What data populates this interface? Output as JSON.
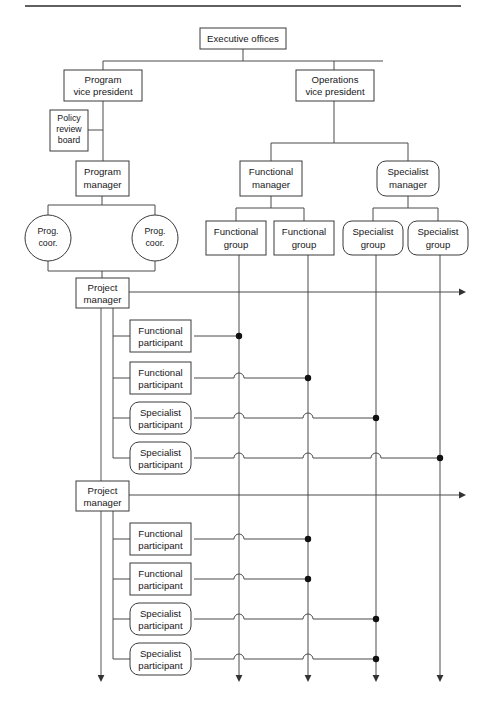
{
  "page": {
    "background_color": "#ffffff",
    "line_color": "#4a4a4a",
    "text_color": "#17171a",
    "top_rule": {
      "x1": 25,
      "y1": 6,
      "x2": 461,
      "y2": 6
    }
  },
  "nodes": {
    "executive_offices": {
      "label": "Executive offices",
      "shape": "rect",
      "x": 200,
      "y": 28,
      "w": 86,
      "h": 21
    },
    "program_vp": {
      "label_line1": "Program",
      "label_line2": "vice president",
      "shape": "rect",
      "x": 64,
      "y": 70,
      "w": 78,
      "h": 31
    },
    "operations_vp": {
      "label_line1": "Operations",
      "label_line2": "vice president",
      "shape": "rect",
      "x": 296,
      "y": 70,
      "w": 78,
      "h": 31
    },
    "policy_review_board": {
      "label_line1": "Policy",
      "label_line2": "review",
      "label_line3": "board",
      "shape": "rect",
      "x": 50,
      "y": 110,
      "w": 38,
      "h": 41
    },
    "program_manager": {
      "label_line1": "Program",
      "label_line2": "manager",
      "shape": "rect",
      "x": 76,
      "y": 161,
      "w": 53,
      "h": 35
    },
    "functional_manager": {
      "label_line1": "Functional",
      "label_line2": "manager",
      "shape": "rect",
      "x": 240,
      "y": 161,
      "w": 62,
      "h": 35
    },
    "specialist_manager": {
      "label_line1": "Specialist",
      "label_line2": "manager",
      "shape": "rounded",
      "x": 377,
      "y": 161,
      "w": 62,
      "h": 35
    },
    "prog_coor_left": {
      "label_line1": "Prog.",
      "label_line2": "coor.",
      "shape": "ellipse",
      "cx": 48,
      "cy": 238,
      "rx": 23,
      "ry": 23
    },
    "prog_coor_right": {
      "label_line1": "Prog.",
      "label_line2": "coor.",
      "shape": "ellipse",
      "cx": 155,
      "cy": 238,
      "rx": 23,
      "ry": 23
    },
    "functional_group_1": {
      "label_line1": "Functional",
      "label_line2": "group",
      "shape": "rect",
      "x": 206,
      "y": 221,
      "w": 60,
      "h": 34
    },
    "functional_group_2": {
      "label_line1": "Functional",
      "label_line2": "group",
      "shape": "rect",
      "x": 274,
      "y": 221,
      "w": 60,
      "h": 34
    },
    "specialist_group_1": {
      "label_line1": "Specialist",
      "label_line2": "group",
      "shape": "rounded",
      "x": 343,
      "y": 221,
      "w": 60,
      "h": 34
    },
    "specialist_group_2": {
      "label_line1": "Specialist",
      "label_line2": "group",
      "shape": "rounded",
      "x": 408,
      "y": 221,
      "w": 60,
      "h": 34
    },
    "project_manager_1": {
      "label_line1": "Project",
      "label_line2": "manager",
      "shape": "rect",
      "x": 76,
      "y": 278,
      "w": 53,
      "h": 30
    },
    "project_manager_2": {
      "label_line1": "Project",
      "label_line2": "manager",
      "shape": "rect",
      "x": 76,
      "y": 481,
      "w": 53,
      "h": 30
    }
  },
  "participant_label_functional_1": "Functional",
  "participant_label_functional_2": "participant",
  "participant_label_specialist_1": "Specialist",
  "participant_label_specialist_2": "participant",
  "columns": {
    "labels": [
      "Functional group",
      "Functional group",
      "Specialist group",
      "Specialist group"
    ],
    "x_positions": [
      239,
      308,
      376,
      440
    ],
    "top_y": 255,
    "bottom_y": 678
  },
  "blocks": [
    {
      "project_manager": "Project manager",
      "box_x": 130,
      "box_w": 61,
      "bus_x": 113,
      "arrow_y": 292,
      "arrow_end_x": 466,
      "participants": [
        {
          "type": "functional",
          "line1": "Functional",
          "line2": "participant",
          "y": 320,
          "h": 32,
          "shape": "rect",
          "terminates_at_column": 0,
          "hops_over": []
        },
        {
          "type": "functional",
          "line1": "Functional",
          "line2": "participant",
          "y": 362,
          "h": 32,
          "shape": "rect",
          "terminates_at_column": 1,
          "hops_over": [
            0
          ]
        },
        {
          "type": "specialist",
          "line1": "Specialist",
          "line2": "participant",
          "y": 402,
          "h": 32,
          "shape": "rounded",
          "terminates_at_column": 2,
          "hops_over": [
            0,
            1
          ]
        },
        {
          "type": "specialist",
          "line1": "Specialist",
          "line2": "participant",
          "y": 442,
          "h": 32,
          "shape": "rounded",
          "terminates_at_column": 3,
          "hops_over": [
            0,
            1,
            2
          ]
        }
      ]
    },
    {
      "project_manager": "Project manager",
      "box_x": 130,
      "box_w": 61,
      "bus_x": 113,
      "arrow_y": 495,
      "arrow_end_x": 466,
      "participants": [
        {
          "type": "functional",
          "line1": "Functional",
          "line2": "participant",
          "y": 523,
          "h": 32,
          "shape": "rect",
          "terminates_at_column": 1,
          "hops_over": [
            0
          ]
        },
        {
          "type": "functional",
          "line1": "Functional",
          "line2": "participant",
          "y": 563,
          "h": 32,
          "shape": "rect",
          "terminates_at_column": 1,
          "hops_over": [
            0
          ]
        },
        {
          "type": "specialist",
          "line1": "Specialist",
          "line2": "participant",
          "y": 603,
          "h": 32,
          "shape": "rounded",
          "terminates_at_column": 2,
          "hops_over": [
            0,
            1
          ]
        },
        {
          "type": "specialist",
          "line1": "Specialist",
          "line2": "participant",
          "y": 643,
          "h": 32,
          "shape": "rounded",
          "terminates_at_column": 2,
          "hops_over": [
            0,
            1
          ]
        }
      ]
    }
  ],
  "left_spine": {
    "x": 101,
    "top_y": 308,
    "bottom_y": 682
  }
}
